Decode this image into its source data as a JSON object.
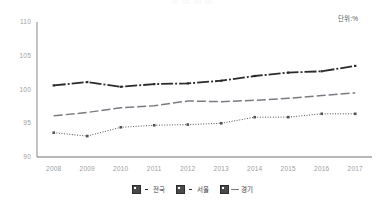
{
  "title_partial": "주 택 매 매",
  "unit_label": "단위:%",
  "chart_data": {
    "type": "line",
    "title": "",
    "xlabel": "",
    "ylabel": "",
    "unit": "%",
    "ylim": [
      90,
      110
    ],
    "yticks": [
      90,
      95,
      100,
      105,
      110
    ],
    "grid": false,
    "legend_position": "bottom",
    "categories": [
      "2008",
      "2009",
      "2010",
      "2011",
      "2012",
      "2013",
      "2014",
      "2015",
      "2016",
      "2017"
    ],
    "series": [
      {
        "name": "전국",
        "style": "solid-dark",
        "color": "#2b2b2b",
        "values": [
          100.6,
          101.1,
          100.4,
          100.8,
          100.9,
          101.3,
          102.0,
          102.5,
          102.7,
          103.5
        ]
      },
      {
        "name": "서울",
        "style": "dotted",
        "color": "#4f5358",
        "values": [
          93.6,
          93.1,
          94.4,
          94.7,
          94.8,
          95.0,
          95.9,
          95.9,
          96.4,
          96.4
        ]
      },
      {
        "name": "경기",
        "style": "dashed",
        "color": "#787c81",
        "values": [
          96.1,
          96.6,
          97.3,
          97.6,
          98.3,
          98.2,
          98.4,
          98.7,
          99.1,
          99.5
        ]
      }
    ]
  },
  "legend": {
    "items": [
      {
        "label": "전국",
        "marker": "dot"
      },
      {
        "label": "서울",
        "marker": "dot"
      },
      {
        "label": "경기",
        "marker": "dash"
      }
    ]
  }
}
